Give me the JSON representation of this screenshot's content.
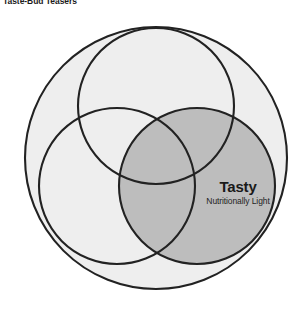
{
  "header": {
    "title": "Taste-Bud Teasers"
  },
  "diagram": {
    "type": "venn-3-set-with-universe",
    "universe": {
      "name": "outer-universe-circle",
      "cx": 156,
      "cy": 158,
      "r": 131,
      "fill": "#eeeeee",
      "stroke": "#222222"
    },
    "sets": [
      {
        "id": "top",
        "name": "set-circle-top",
        "cx": 156,
        "cy": 106,
        "r": 78,
        "fill": "none",
        "stroke": "#222222",
        "highlighted": false
      },
      {
        "id": "bottom-left",
        "name": "set-circle-bottom-left",
        "cx": 117,
        "cy": 186,
        "r": 78,
        "fill": "none",
        "stroke": "#222222",
        "highlighted": false
      },
      {
        "id": "bottom-right",
        "name": "set-circle-bottom-right",
        "cx": 197,
        "cy": 186,
        "r": 78,
        "fill": "#bdbdbd",
        "stroke": "#222222",
        "highlighted": true
      }
    ],
    "callout": {
      "name": "highlighted-set-callout",
      "label": "Tasty",
      "sublabel": "Nutritionally Light",
      "attached_to": "bottom-right"
    }
  },
  "colors": {
    "background": "#ffffff",
    "universe_fill": "#eeeeee",
    "highlight_fill": "#bdbdbd",
    "stroke": "#222222",
    "text": "#1a1a1a"
  }
}
